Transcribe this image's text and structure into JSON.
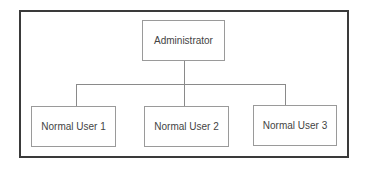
{
  "diagram": {
    "type": "org-hierarchy",
    "root": {
      "label": "Administrator"
    },
    "children": [
      {
        "label": "Normal User 1"
      },
      {
        "label": "Normal User 2"
      },
      {
        "label": "Normal User 3"
      }
    ],
    "colors": {
      "frame_border": "#3a3a3a",
      "node_border": "#9a9a9a",
      "connector": "#8a8a8a",
      "text": "#444444",
      "background": "#ffffff"
    }
  }
}
